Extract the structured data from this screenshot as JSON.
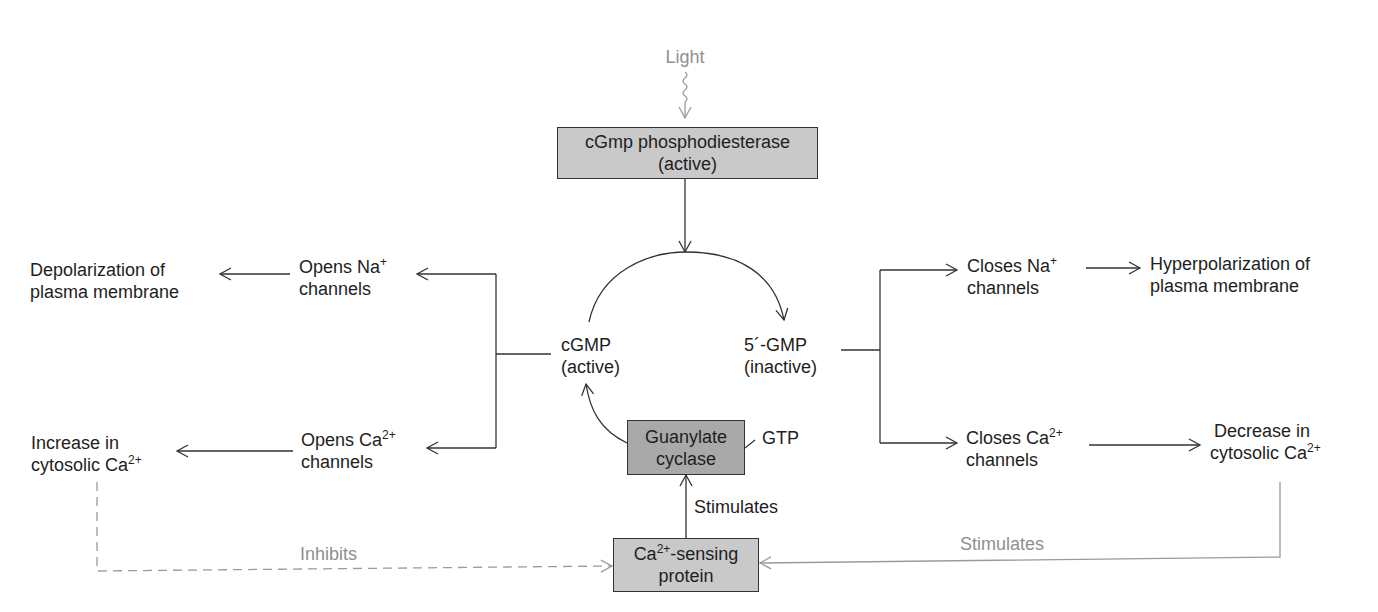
{
  "colors": {
    "background": "#ffffff",
    "line": "#333333",
    "muted_line": "#9a9a9a",
    "box_light": "#c9c9c9",
    "box_dark": "#a9a9a9",
    "text": "#1e1e1e",
    "muted_text": "#8f8f8f"
  },
  "stimulus": {
    "label": "Light"
  },
  "nodes": {
    "pde": {
      "line1": "cGmp phosphodiesterase",
      "line2": "(active)"
    },
    "cgmp": {
      "line1": "cGMP",
      "line2": "(active)"
    },
    "gmp5": {
      "line1": "5´-GMP",
      "line2": "(inactive)"
    },
    "guanylate_cyclase": {
      "line1": "Guanylate",
      "line2": "cyclase"
    },
    "gtp": {
      "label": "GTP"
    },
    "ca_sensing": {
      "ion": "Ca",
      "charge": "2+",
      "rest": "-sensing",
      "line2": "protein"
    },
    "opens_na": {
      "line1_text": "Opens Na",
      "line1_charge": "+",
      "line2": "channels"
    },
    "opens_ca": {
      "line1_text": "Opens Ca",
      "line1_charge": "2+",
      "line2": "channels"
    },
    "depolarization": {
      "line1": "Depolarization of",
      "line2": "plasma membrane"
    },
    "increase_ca": {
      "line1": "Increase in",
      "line2_text": "cytosolic Ca",
      "line2_charge": "2+"
    },
    "closes_na": {
      "line1_text": "Closes Na",
      "line1_charge": "+",
      "line2": "channels"
    },
    "closes_ca": {
      "line1_text": "Closes Ca",
      "line1_charge": "2+",
      "line2": "channels"
    },
    "hyperpolarization": {
      "line1": "Hyperpolarization of",
      "line2": "plasma membrane"
    },
    "decrease_ca": {
      "line1": "Decrease in",
      "line2_text": "cytosolic Ca",
      "line2_charge": "2+"
    }
  },
  "edges": {
    "stimulates_gc": "Stimulates",
    "inhibits": "Inhibits",
    "stimulates_feedback": "Stimulates"
  }
}
